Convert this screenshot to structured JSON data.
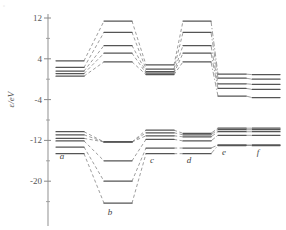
{
  "figure": {
    "type": "orbital-correlation-diagram",
    "axis_title": "ε/eV",
    "corner_mark": "°"
  },
  "chart_data": {
    "type": "line",
    "title": "",
    "xlabel": "",
    "ylabel": "ε/eV",
    "ylim": [
      -28,
      12
    ],
    "grid": false,
    "legend": "none",
    "y_major_ticks": [
      12,
      4,
      -4,
      -12,
      -20
    ],
    "y_major_tick_labels": [
      "12",
      "4",
      "-4",
      "-12",
      "-20"
    ],
    "y_minor_ticks": [
      8,
      0,
      -8,
      -16,
      -24
    ],
    "categories": [
      "a",
      "b",
      "c",
      "d",
      "e",
      "f"
    ],
    "category_label_style": "italic",
    "series": [
      {
        "name": "u1",
        "band": "upper",
        "values": [
          3.6,
          11.4,
          2.8,
          11.4,
          1.0,
          0.9
        ]
      },
      {
        "name": "u2",
        "band": "upper",
        "values": [
          2.3,
          9.2,
          2.0,
          9.2,
          0.2,
          0.0
        ]
      },
      {
        "name": "u3",
        "band": "upper",
        "values": [
          1.6,
          6.6,
          1.5,
          6.6,
          -0.9,
          -1.0
        ]
      },
      {
        "name": "u4",
        "band": "upper",
        "values": [
          1.1,
          5.1,
          1.2,
          5.1,
          -1.8,
          -2.0
        ]
      },
      {
        "name": "u5",
        "band": "upper",
        "values": [
          0.6,
          3.4,
          0.9,
          3.4,
          -3.3,
          -3.6
        ]
      },
      {
        "name": "l1",
        "band": "lower",
        "values": [
          -10.3,
          -12.3,
          -10.0,
          -10.6,
          -9.6,
          -9.6
        ]
      },
      {
        "name": "l2",
        "band": "lower",
        "values": [
          -10.9,
          -12.3,
          -10.5,
          -10.9,
          -9.9,
          -9.9
        ]
      },
      {
        "name": "l3",
        "band": "lower",
        "values": [
          -11.6,
          -12.3,
          -11.1,
          -11.3,
          -10.3,
          -10.3
        ]
      },
      {
        "name": "l4",
        "band": "lower",
        "values": [
          -12.1,
          -16.0,
          -11.8,
          -12.1,
          -11.0,
          -11.0
        ]
      },
      {
        "name": "l5",
        "band": "lower",
        "values": [
          -13.3,
          -20.0,
          -13.5,
          -13.5,
          -12.9,
          -12.9
        ]
      },
      {
        "name": "l6",
        "band": "lower",
        "values": [
          -14.6,
          -24.3,
          -14.6,
          -14.6,
          -13.0,
          -13.0
        ]
      }
    ],
    "connector_style": "dashed",
    "connector_style_right": "dash-dot",
    "level_color": "#555555",
    "connector_color": "#8d8d8d"
  }
}
